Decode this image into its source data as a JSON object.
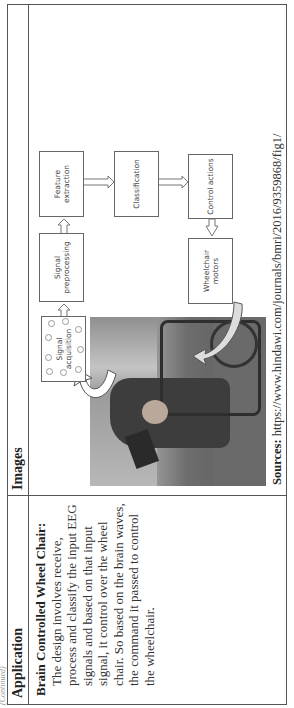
{
  "continued_label": "(Continued)",
  "table": {
    "headers": {
      "application": "Application",
      "images": "Images"
    },
    "row": {
      "application_title": "Brain Controlled Wheel Chair:",
      "application_desc": "The design involves receive, process and classify the input EEG signals and based on that input signal, it control over the wheel chair. So based on the brain waves, the command it passed to control the wheelchair.",
      "diagram": {
        "boxes": {
          "signal_acquisition": "Signal acquisition",
          "signal_preprocessing": "Signal preprocessing",
          "feature_extraction": "Feature extraction",
          "classification": "Classification",
          "control_actions": "Control actions",
          "wheelchair_motors": "Wheelchair motors"
        },
        "photo_alt": "Person seated in a wheelchair wearing an EEG headset"
      },
      "sources_label": "Sources:",
      "sources_url": "https://www.hindawi.com/journals/bmri/2016/9359868/fig1/"
    }
  }
}
